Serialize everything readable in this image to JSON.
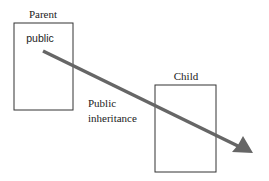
{
  "parent": {
    "title": "Parent",
    "member": "public",
    "box": {
      "x": 14,
      "y": 23,
      "w": 59,
      "h": 87
    }
  },
  "child": {
    "title": "Child",
    "box": {
      "x": 155,
      "y": 85,
      "w": 61,
      "h": 87
    }
  },
  "arrow": {
    "label_line1": "Public",
    "label_line2": "inheritance",
    "from": [
      43,
      51
    ],
    "to": [
      252,
      153
    ],
    "color": "#666666"
  },
  "colors": {
    "box_stroke": "#333333",
    "text": "#222222",
    "arrow": "#666666"
  }
}
